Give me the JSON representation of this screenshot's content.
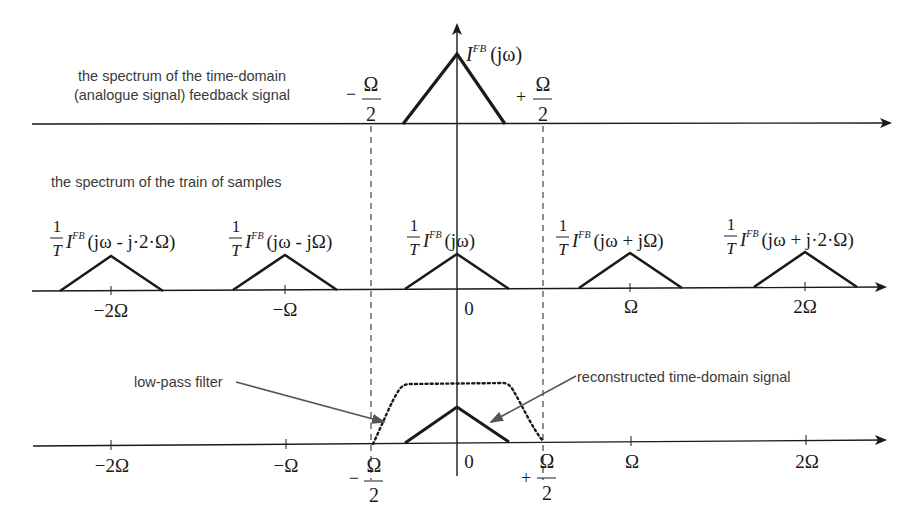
{
  "diagram": {
    "panels": [
      {
        "id": "analogue",
        "label_line1": "the spectrum of the time-domain",
        "label_line2": "(analogue signal) feedback signal",
        "curve_label": {
          "symbol": "I",
          "superscript": "FB",
          "argument": "(jω)"
        },
        "band_edges": {
          "left": {
            "sign": "−",
            "num": "Ω",
            "den": "2"
          },
          "right": {
            "sign": "+",
            "num": "Ω",
            "den": "2"
          }
        }
      },
      {
        "id": "samples",
        "label": "the spectrum of the train of samples",
        "replicas": [
          {
            "coef_num": "1",
            "coef_den": "T",
            "symbol": "I",
            "superscript": "FB",
            "argument": "(jω - j·2·Ω)",
            "tick": "−2Ω"
          },
          {
            "coef_num": "1",
            "coef_den": "T",
            "symbol": "I",
            "superscript": "FB",
            "argument": "(jω - jΩ)",
            "tick": "−Ω"
          },
          {
            "coef_num": "1",
            "coef_den": "T",
            "symbol": "I",
            "superscript": "FB",
            "argument": "(jω)",
            "tick": "0"
          },
          {
            "coef_num": "1",
            "coef_den": "T",
            "symbol": "I",
            "superscript": "FB",
            "argument": "(jω + jΩ)",
            "tick": "Ω"
          },
          {
            "coef_num": "1",
            "coef_den": "T",
            "symbol": "I",
            "superscript": "FB",
            "argument": "(jω + j·2·Ω)",
            "tick": "2Ω"
          }
        ]
      },
      {
        "id": "reconstruction",
        "annotations": {
          "filter": "low-pass filter",
          "signal": "reconstructed time-domain signal"
        },
        "ticks": [
          "−2Ω",
          "−Ω",
          "0",
          "Ω",
          "2Ω"
        ],
        "band_edges": {
          "left": {
            "sign": "−",
            "num": "Ω",
            "den": "2"
          },
          "right": {
            "sign": "+",
            "num": "Ω",
            "den": "2"
          }
        }
      }
    ],
    "colors": {
      "line": "#1a1a1a",
      "annotation_arrow": "#555555",
      "text": "#3a3a3a"
    }
  }
}
